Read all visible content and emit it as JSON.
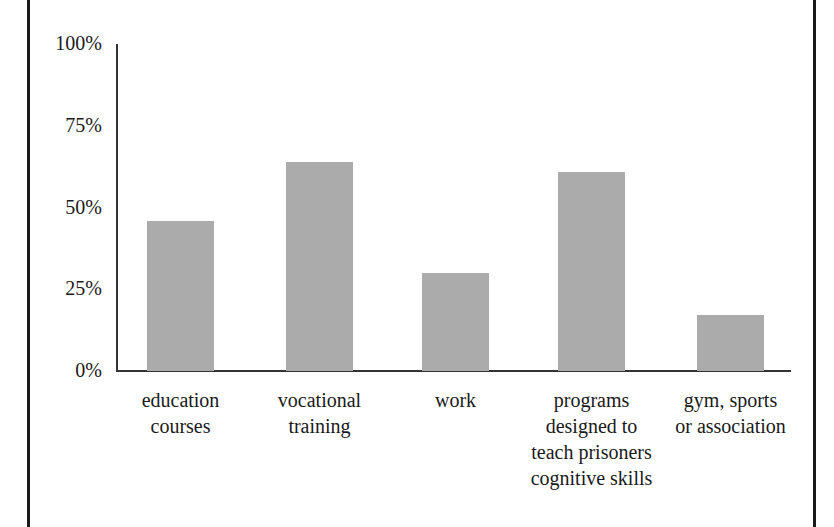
{
  "chart_data": {
    "type": "bar",
    "title": "",
    "xlabel": "",
    "ylabel": "",
    "ylim": [
      0,
      100
    ],
    "yticks": [
      "0%",
      "25%",
      "50%",
      "75%",
      "100%"
    ],
    "grid": false,
    "legend": null,
    "categories": [
      "education courses",
      "vocational training",
      "work",
      "programs designed to teach prisoners cognitive skills",
      "gym, sports or association"
    ],
    "category_label_lines": [
      "education\ncourses",
      "vocational\ntraining",
      "work",
      "programs\ndesigned to\nteach prisoners\ncognitive skills",
      "gym, sports\nor association"
    ],
    "values": [
      46,
      64,
      30,
      61,
      17
    ],
    "bar_color": "#ababab",
    "axis_color": "#333333"
  }
}
